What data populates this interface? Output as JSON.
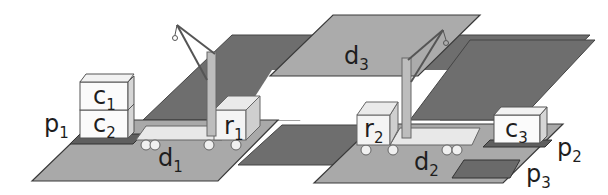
{
  "diagram": {
    "type": "dock-worker-robots-scene",
    "colors": {
      "light_dock": "#a9a9a9",
      "dark_road": "#6e6e6e",
      "pile_base": "#5f5f5f",
      "container_face": "#fbfbfb",
      "container_side": "#d6d6d6",
      "robot_deck": "#e8e8e8",
      "crane_pole": "#bdbdbd",
      "outline": "#3a3a3a"
    },
    "locations": [
      {
        "id": "d1",
        "base": "d",
        "sub": "1"
      },
      {
        "id": "d2",
        "base": "d",
        "sub": "2"
      },
      {
        "id": "d3",
        "base": "d",
        "sub": "3"
      }
    ],
    "piles": [
      {
        "id": "p1",
        "base": "p",
        "sub": "1"
      },
      {
        "id": "p2",
        "base": "p",
        "sub": "2"
      },
      {
        "id": "p3",
        "base": "p",
        "sub": "3"
      }
    ],
    "containers": [
      {
        "id": "c1",
        "base": "c",
        "sub": "1",
        "pile": "p1",
        "position": "top"
      },
      {
        "id": "c2",
        "base": "c",
        "sub": "2",
        "pile": "p1",
        "position": "bottom"
      },
      {
        "id": "c3",
        "base": "c",
        "sub": "3",
        "pile": "p2",
        "position": "bottom"
      }
    ],
    "robots": [
      {
        "id": "r1",
        "base": "r",
        "sub": "1",
        "location": "d1"
      },
      {
        "id": "r2",
        "base": "r",
        "sub": "2",
        "location": "d2"
      }
    ],
    "cranes": [
      {
        "id": "crane-d1",
        "location": "d1"
      },
      {
        "id": "crane-d2",
        "location": "d2"
      }
    ]
  }
}
